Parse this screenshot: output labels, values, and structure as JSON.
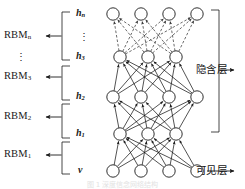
{
  "figure": {
    "caption_faint": "图 1 深度信念网络结构",
    "node_fill": "#ffffff",
    "node_stroke": "#1a1a1a",
    "solid_edge_color": "#1a1a1a",
    "dashed_edge_color": "#3a3a3a",
    "text_color": "#1a1a1a"
  },
  "rbm_labels": [
    {
      "id": "rbm-n",
      "base": "RBM",
      "sub": "n",
      "y": 36
    },
    {
      "id": "rbm-3",
      "base": "RBM",
      "sub": "3",
      "y": 77
    },
    {
      "id": "rbm-2",
      "base": "RBM",
      "sub": "2",
      "y": 117
    },
    {
      "id": "rbm-1",
      "base": "RBM",
      "sub": "1",
      "y": 155
    }
  ],
  "rbm_ellipsis": "⋮",
  "layer_labels": [
    {
      "id": "layer-hn",
      "base": "h",
      "sub": "n",
      "y": 14
    },
    {
      "id": "layer-h3",
      "base": "h",
      "sub": "3",
      "y": 57
    },
    {
      "id": "layer-h2",
      "base": "h",
      "sub": "2",
      "y": 97
    },
    {
      "id": "layer-h1",
      "base": "h",
      "sub": "1",
      "y": 134
    },
    {
      "id": "layer-v",
      "base": "v",
      "sub": "",
      "y": 171
    }
  ],
  "layer_ellipsis": "⋮",
  "side_labels": {
    "hidden": "隐含层",
    "visible": "可见层"
  },
  "chart_data": {
    "type": "diagram",
    "diagram_kind": "deep-belief-network",
    "layers": [
      {
        "name": "h_n",
        "display": "hₙ",
        "nodes": 4,
        "y": 14,
        "xs": [
          113,
          141,
          169,
          197
        ]
      },
      {
        "name": "h_3",
        "display": "h₃",
        "nodes": 3,
        "y": 57,
        "xs": [
          120,
          148,
          176
        ]
      },
      {
        "name": "h_2",
        "display": "h₂",
        "nodes": 4,
        "y": 97,
        "xs": [
          113,
          141,
          169,
          197
        ]
      },
      {
        "name": "h_1",
        "display": "h₁",
        "nodes": 3,
        "y": 134,
        "xs": [
          120,
          148,
          176
        ]
      },
      {
        "name": "v",
        "display": "v",
        "nodes": 4,
        "y": 171,
        "xs": [
          113,
          141,
          169,
          197
        ]
      }
    ],
    "connections": [
      {
        "from": "h_3",
        "to": "h_n",
        "style": "dashed",
        "arrow": true
      },
      {
        "from": "h_2",
        "to": "h_3",
        "style": "solid",
        "arrow": true
      },
      {
        "from": "h_1",
        "to": "h_2",
        "style": "solid",
        "arrow": true
      },
      {
        "from": "v",
        "to": "h_1",
        "style": "solid",
        "arrow": true
      }
    ],
    "rbm_groups": [
      {
        "label": "RBM_n",
        "spans": [
          "h_3",
          "h_n"
        ]
      },
      {
        "label": "RBM_3",
        "spans": [
          "h_3"
        ]
      },
      {
        "label": "RBM_2",
        "spans": [
          "h_1",
          "h_2"
        ]
      },
      {
        "label": "RBM_1",
        "spans": [
          "v",
          "h_1"
        ]
      }
    ],
    "annotations": [
      {
        "text": "隐含层",
        "target": "h_1..h_n",
        "side": "right"
      },
      {
        "text": "可见层",
        "target": "v",
        "side": "right"
      }
    ]
  }
}
